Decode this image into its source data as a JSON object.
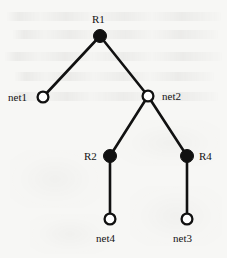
{
  "figure": {
    "kind": "network-tree-diagram",
    "background_color": "#f7f7f5",
    "ink_color": "#111111",
    "width": 227,
    "height": 258
  },
  "legend": {
    "filled_node_meaning": "router",
    "open_node_meaning": "network"
  },
  "nodes": [
    {
      "id": "R1",
      "label": "R1",
      "type": "filled",
      "x": 100,
      "y": 36,
      "r": 6.5,
      "label_x": 92,
      "label_y": 14
    },
    {
      "id": "net1",
      "label": "net1",
      "type": "open",
      "x": 43,
      "y": 97,
      "r": 6.5,
      "label_x": 8,
      "label_y": 92
    },
    {
      "id": "net2",
      "label": "net2",
      "type": "open",
      "x": 148,
      "y": 96,
      "r": 6.5,
      "label_x": 162,
      "label_y": 91
    },
    {
      "id": "R2",
      "label": "R2",
      "type": "filled",
      "x": 110,
      "y": 156,
      "r": 6.5,
      "label_x": 84,
      "label_y": 151
    },
    {
      "id": "R4",
      "label": "R4",
      "type": "filled",
      "x": 187,
      "y": 156,
      "r": 6.5,
      "label_x": 199,
      "label_y": 151
    },
    {
      "id": "net4",
      "label": "net4",
      "type": "open",
      "x": 110,
      "y": 219,
      "r": 6.5,
      "label_x": 96,
      "label_y": 233
    },
    {
      "id": "net3",
      "label": "net3",
      "type": "open",
      "x": 187,
      "y": 219,
      "r": 6.5,
      "label_x": 173,
      "label_y": 233
    }
  ],
  "edges": [
    {
      "from": "R1",
      "to": "net1",
      "x1": 100,
      "y1": 36,
      "x2": 43,
      "y2": 97
    },
    {
      "from": "R1",
      "to": "net2",
      "x1": 100,
      "y1": 36,
      "x2": 148,
      "y2": 96
    },
    {
      "from": "net2",
      "to": "R2",
      "x1": 148,
      "y1": 96,
      "x2": 110,
      "y2": 156
    },
    {
      "from": "net2",
      "to": "R4",
      "x1": 148,
      "y1": 96,
      "x2": 187,
      "y2": 156
    },
    {
      "from": "R2",
      "to": "net4",
      "x1": 110,
      "y1": 156,
      "x2": 110,
      "y2": 219
    },
    {
      "from": "R4",
      "to": "net3",
      "x1": 187,
      "y1": 156,
      "x2": 187,
      "y2": 219
    }
  ],
  "ghost_text": {
    "description": "illegible faint bleed-through from reverse side of scanned page",
    "lines": [
      {
        "x": 6,
        "y": 12,
        "w": 215
      },
      {
        "x": 12,
        "y": 30,
        "w": 206
      },
      {
        "x": 4,
        "y": 52,
        "w": 218
      },
      {
        "x": 14,
        "y": 72,
        "w": 200
      },
      {
        "x": 8,
        "y": 92,
        "w": 210
      }
    ],
    "smudges": [
      {
        "x": 120,
        "y": 120,
        "w": 100,
        "h": 46
      },
      {
        "x": 10,
        "y": 150,
        "w": 90,
        "h": 58
      },
      {
        "x": 130,
        "y": 186,
        "w": 92,
        "h": 60
      },
      {
        "x": 30,
        "y": 214,
        "w": 80,
        "h": 40
      }
    ]
  }
}
